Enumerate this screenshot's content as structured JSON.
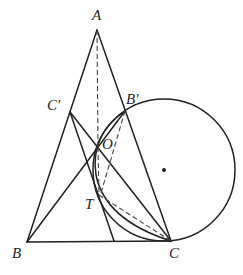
{
  "diagram": {
    "type": "geometry",
    "labels": {
      "A": "A",
      "B": "B",
      "C": "C",
      "C_prime": "C′",
      "B_prime": "B′",
      "O": "O",
      "T": "T"
    },
    "stroke_color": "#222222",
    "background": "#ffffff"
  }
}
